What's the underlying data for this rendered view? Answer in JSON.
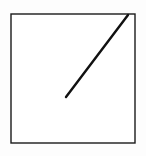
{
  "figure": {
    "title": "",
    "canvas": {
      "width": 146,
      "height": 156,
      "background_color": "#fdfdfd"
    },
    "shapes": [
      {
        "name": "square-border",
        "type": "rectangle",
        "x": 11,
        "y": 14,
        "width": 124,
        "height": 129,
        "stroke_color": "#1a1a1a",
        "stroke_width": 1.4,
        "fill_color": "#ffffff"
      },
      {
        "name": "diagonal-line-segment",
        "type": "line",
        "x1": 66,
        "y1": 97,
        "x2": 128,
        "y2": 15,
        "stroke_color": "#111111",
        "stroke_width": 2.4,
        "stroke_linecap": "round"
      }
    ]
  }
}
